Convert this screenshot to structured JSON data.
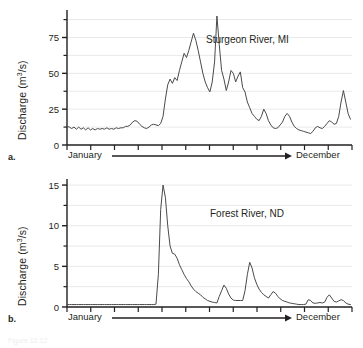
{
  "figure": {
    "caption": "Figure 12.12",
    "axis_arrow_start_label": "January",
    "axis_arrow_end_label": "December"
  },
  "panels": [
    {
      "letter": "a.",
      "title": "Sturgeon River, MI",
      "ylabel_prefix": "Discharge (m",
      "ylabel_exp": "3",
      "ylabel_suffix": "/s)"
    },
    {
      "letter": "b.",
      "title": "Forest River, ND",
      "ylabel_prefix": "Discharge (m",
      "ylabel_exp": "3",
      "ylabel_suffix": "/s)"
    }
  ],
  "chart_data": [
    {
      "type": "line",
      "title": "Sturgeon River, MI",
      "xlabel": "January → December",
      "ylabel": "Discharge (m3/s)",
      "ylim": [
        0,
        90
      ],
      "yticks": [
        0,
        25,
        50,
        75
      ],
      "yticks_minor": [
        12.5,
        37.5,
        62.5,
        87.5
      ],
      "xlim": [
        0,
        365
      ],
      "xticks_count": 12,
      "grid": "horizontal",
      "x": [
        0,
        3,
        6,
        9,
        12,
        15,
        18,
        21,
        24,
        27,
        30,
        33,
        36,
        39,
        42,
        45,
        48,
        51,
        54,
        57,
        60,
        63,
        66,
        69,
        72,
        75,
        78,
        81,
        84,
        87,
        90,
        93,
        96,
        99,
        102,
        105,
        108,
        111,
        114,
        117,
        120,
        123,
        126,
        129,
        132,
        135,
        138,
        141,
        144,
        147,
        150,
        153,
        156,
        159,
        162,
        165,
        168,
        171,
        174,
        177,
        180,
        183,
        186,
        189,
        192,
        195,
        198,
        201,
        204,
        207,
        210,
        213,
        216,
        219,
        222,
        225,
        228,
        231,
        234,
        237,
        240,
        243,
        246,
        249,
        252,
        255,
        258,
        261,
        264,
        267,
        270,
        273,
        276,
        279,
        282,
        285,
        288,
        291,
        294,
        297,
        300,
        303,
        306,
        309,
        312,
        315,
        318,
        321,
        324,
        327,
        330,
        333,
        336,
        339,
        342,
        345,
        348,
        351,
        354,
        357,
        360,
        363
      ],
      "values": [
        13,
        12.5,
        11.5,
        12.5,
        11,
        12.5,
        11,
        12,
        10.5,
        12,
        10.5,
        11.5,
        10.5,
        11.5,
        11,
        11.5,
        11,
        12,
        11,
        11.5,
        11,
        12,
        11.5,
        12,
        12,
        13,
        13,
        14,
        16,
        17,
        16.5,
        14.5,
        13,
        12,
        11.5,
        12.5,
        14,
        14.5,
        14,
        13.5,
        15,
        20,
        32,
        42,
        46,
        43,
        47,
        45,
        52,
        58,
        64,
        61,
        66,
        72,
        78,
        73,
        66,
        58,
        50,
        44,
        40,
        37,
        44,
        58,
        90,
        70,
        52,
        46,
        38,
        44,
        52,
        50,
        44,
        48,
        51,
        40,
        37,
        30,
        26,
        22,
        20,
        18,
        17,
        20,
        25,
        22,
        17,
        14,
        12,
        11.5,
        12,
        14,
        16,
        20,
        22,
        20,
        16,
        13,
        11.5,
        10.5,
        10,
        9.5,
        9,
        8.5,
        8,
        9.5,
        12,
        13,
        12,
        11.5,
        13,
        15,
        17,
        16,
        14.5,
        15,
        20,
        30,
        38,
        30,
        22,
        18,
        19,
        22,
        26,
        29,
        24,
        19,
        16,
        14,
        13,
        12.5
      ],
      "annotations": [
        {
          "text": "Sturgeon River, MI",
          "x": 0.62,
          "y": 0.78
        }
      ]
    },
    {
      "type": "line",
      "title": "Forest River, ND",
      "xlabel": "January → December",
      "ylabel": "Discharge (m3/s)",
      "ylim": [
        0,
        15.5
      ],
      "yticks": [
        0,
        5,
        10,
        15
      ],
      "yticks_minor": [
        2.5,
        7.5,
        12.5
      ],
      "xlim": [
        0,
        365
      ],
      "xticks_count": 12,
      "grid": "horizontal",
      "x": [
        0,
        3,
        6,
        9,
        12,
        15,
        18,
        21,
        24,
        27,
        30,
        33,
        36,
        39,
        42,
        45,
        48,
        51,
        54,
        57,
        60,
        63,
        66,
        69,
        72,
        75,
        78,
        81,
        84,
        87,
        90,
        93,
        96,
        99,
        102,
        105,
        108,
        111,
        114,
        117,
        120,
        123,
        126,
        129,
        132,
        135,
        138,
        141,
        144,
        147,
        150,
        153,
        156,
        159,
        162,
        165,
        168,
        171,
        174,
        177,
        180,
        183,
        186,
        189,
        192,
        195,
        198,
        201,
        204,
        207,
        210,
        213,
        216,
        219,
        222,
        225,
        228,
        231,
        234,
        237,
        240,
        243,
        246,
        249,
        252,
        255,
        258,
        261,
        264,
        267,
        270,
        273,
        276,
        279,
        282,
        285,
        288,
        291,
        294,
        297,
        300,
        303,
        306,
        309,
        312,
        315,
        318,
        321,
        324,
        327,
        330,
        333,
        336,
        339,
        342,
        345,
        348,
        351,
        354,
        357,
        360,
        363
      ],
      "values": [
        0.3,
        0.3,
        0.3,
        0.3,
        0.3,
        0.3,
        0.3,
        0.3,
        0.3,
        0.3,
        0.3,
        0.3,
        0.3,
        0.3,
        0.3,
        0.3,
        0.3,
        0.3,
        0.3,
        0.3,
        0.3,
        0.3,
        0.3,
        0.3,
        0.3,
        0.3,
        0.3,
        0.3,
        0.3,
        0.3,
        0.3,
        0.3,
        0.3,
        0.3,
        0.3,
        0.3,
        0.3,
        0.3,
        0.35,
        4.0,
        12.0,
        15.0,
        13.5,
        10.0,
        7.5,
        6.6,
        6.5,
        6.0,
        5.2,
        4.6,
        4.0,
        3.5,
        3.1,
        2.6,
        2.2,
        1.9,
        1.7,
        1.5,
        1.2,
        1.0,
        0.8,
        0.7,
        0.6,
        0.55,
        0.5,
        1.3,
        2.0,
        2.7,
        2.3,
        1.6,
        1.1,
        0.85,
        0.8,
        0.8,
        0.8,
        0.8,
        2.0,
        4.0,
        5.5,
        4.8,
        3.6,
        2.8,
        2.2,
        1.8,
        1.5,
        1.3,
        1.1,
        1.5,
        1.9,
        1.7,
        1.3,
        1.0,
        0.8,
        0.7,
        0.6,
        0.5,
        0.45,
        0.4,
        0.35,
        0.3,
        0.3,
        0.3,
        0.35,
        0.9,
        0.8,
        0.5,
        0.45,
        0.5,
        0.55,
        0.5,
        0.6,
        1.2,
        1.5,
        1.1,
        0.7,
        0.6,
        0.75,
        0.9,
        0.8,
        0.5,
        0.35,
        0.3,
        0.3
      ],
      "annotations": [
        {
          "text": "Forest River, ND",
          "x": 0.62,
          "y": 0.76
        }
      ]
    }
  ]
}
